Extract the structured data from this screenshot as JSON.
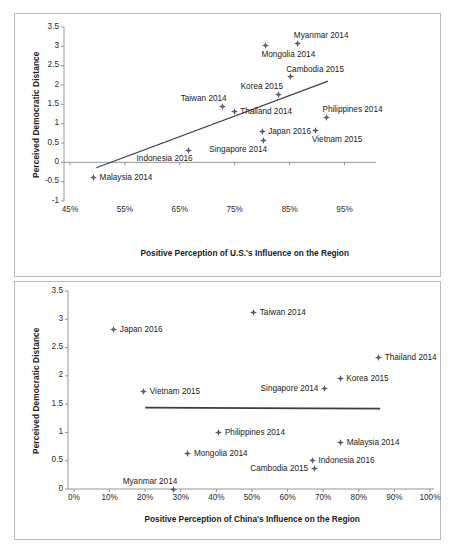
{
  "figure": {
    "panels": [
      "us-influence-scatter",
      "china-influence-scatter"
    ]
  },
  "chart_data": [
    {
      "id": "chart-us",
      "type": "scatter",
      "title": "",
      "xlabel": "Positive Perception of U.S.'s Influence on the Region",
      "ylabel": "Perceived Democratic Distance",
      "xlim": [
        45,
        100
      ],
      "ylim": [
        -1,
        3.5
      ],
      "grid": false,
      "legend": "none",
      "xticklabels": [
        "45%",
        "55%",
        "65%",
        "75%",
        "85%",
        "95%"
      ],
      "xtickvalues": [
        45,
        55,
        65,
        75,
        85,
        95
      ],
      "yticklabels": [
        "3.5",
        "3",
        "2.5",
        "2",
        "1.5",
        "1",
        "0.5",
        "0",
        "-0.5",
        "-1"
      ],
      "ytickvalues": [
        3.5,
        3,
        2.5,
        2,
        1.5,
        1,
        0.5,
        0,
        -0.5,
        -1
      ],
      "trendline": {
        "x0": 49.8,
        "y0": -0.14,
        "x1": 92.0,
        "y1": 2.1
      },
      "points": [
        {
          "label": "Myanmar 2014",
          "x": 86.5,
          "y": 3.08,
          "label_pos": "above-right"
        },
        {
          "label": "Mongolia 2014",
          "x": 80.6,
          "y": 3.02,
          "label_pos": "below-right"
        },
        {
          "label": "Cambodia 2015",
          "x": 85.1,
          "y": 2.21,
          "label_pos": "above-right"
        },
        {
          "label": "Korea 2015",
          "x": 83.0,
          "y": 1.76,
          "label_pos": "above-left"
        },
        {
          "label": "Taiwan 2014",
          "x": 72.8,
          "y": 1.45,
          "label_pos": "above-left"
        },
        {
          "label": "Thailand 2014",
          "x": 74.9,
          "y": 1.31,
          "label_pos": "right"
        },
        {
          "label": "Philippines 2014",
          "x": 91.7,
          "y": 1.16,
          "label_pos": "above-right"
        },
        {
          "label": "Vietnam 2015",
          "x": 89.8,
          "y": 0.82,
          "label_pos": "below-right"
        },
        {
          "label": "Japan 2016",
          "x": 80.0,
          "y": 0.8,
          "label_pos": "right"
        },
        {
          "label": "Singapore 2014",
          "x": 80.2,
          "y": 0.56,
          "label_pos": "below-left"
        },
        {
          "label": "Indonesia 2016",
          "x": 66.6,
          "y": 0.31,
          "label_pos": "below-left"
        },
        {
          "label": "Malaysia 2014",
          "x": 49.3,
          "y": -0.39,
          "label_pos": "right"
        }
      ]
    },
    {
      "id": "chart-china",
      "type": "scatter",
      "title": "",
      "xlabel": "Positive Perception of China's Influence on the Region",
      "ylabel": "Perceived Democratic Distance",
      "xlim": [
        0,
        100
      ],
      "ylim": [
        0,
        3.5
      ],
      "grid": false,
      "legend": "none",
      "xticklabels": [
        "0%",
        "10%",
        "20%",
        "30%",
        "40%",
        "50%",
        "60%",
        "70%",
        "80%",
        "90%",
        "100%"
      ],
      "xtickvalues": [
        0,
        10,
        20,
        30,
        40,
        50,
        60,
        70,
        80,
        90,
        100
      ],
      "yticklabels": [
        "3.5",
        "3",
        "2.5",
        "2",
        "1.5",
        "1",
        "0.5",
        "0"
      ],
      "ytickvalues": [
        3.5,
        3,
        2.5,
        2,
        1.5,
        1,
        0.5,
        0
      ],
      "trendline": {
        "x0": 20.0,
        "y0": 1.44,
        "x1": 86.0,
        "y1": 1.42
      },
      "points": [
        {
          "label": "Taiwan 2014",
          "x": 50.5,
          "y": 3.12,
          "label_pos": "right"
        },
        {
          "label": "Japan 2016",
          "x": 11.2,
          "y": 2.82,
          "label_pos": "right"
        },
        {
          "label": "Thailand 2014",
          "x": 85.6,
          "y": 2.32,
          "label_pos": "right"
        },
        {
          "label": "Korea 2015",
          "x": 74.8,
          "y": 1.95,
          "label_pos": "right"
        },
        {
          "label": "Singapore 2014",
          "x": 70.4,
          "y": 1.77,
          "label_pos": "left"
        },
        {
          "label": "Vietnam 2015",
          "x": 19.6,
          "y": 1.72,
          "label_pos": "right"
        },
        {
          "label": "Philippines 2014",
          "x": 40.7,
          "y": 1.0,
          "label_pos": "right"
        },
        {
          "label": "Malaysia 2014",
          "x": 74.9,
          "y": 0.83,
          "label_pos": "right"
        },
        {
          "label": "Mongolia 2014",
          "x": 32.0,
          "y": 0.62,
          "label_pos": "right"
        },
        {
          "label": "Indonesia 2016",
          "x": 67.0,
          "y": 0.5,
          "label_pos": "right"
        },
        {
          "label": "Cambodia 2015",
          "x": 67.5,
          "y": 0.37,
          "label_pos": "left"
        },
        {
          "label": "Myanmar 2014",
          "x": 28.0,
          "y": 0.0,
          "label_pos": "above-left"
        }
      ]
    }
  ]
}
